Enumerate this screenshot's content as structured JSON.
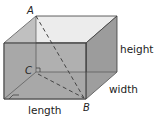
{
  "diagram": {
    "type": "rectangular-prism",
    "points": {
      "A": "A",
      "B": "B",
      "C": "C"
    },
    "dimensions": {
      "height": "height",
      "width": "width",
      "length": "length"
    },
    "colors": {
      "front_face": "#a9a9a9",
      "top_face": "#ececec",
      "side_face": "#9a9a9a",
      "edge": "#3a3a3a",
      "dashed": "#444444"
    }
  }
}
